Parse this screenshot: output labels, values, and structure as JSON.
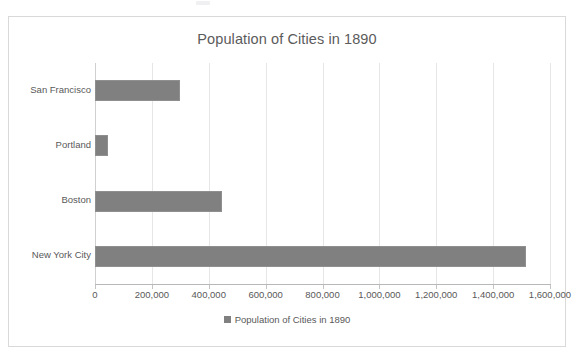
{
  "chart_data": {
    "type": "bar",
    "orientation": "horizontal",
    "title": "Population of Cities in 1890",
    "xlabel": "",
    "ylabel": "",
    "categories": [
      "San Francisco",
      "Portland",
      "Boston",
      "New York City"
    ],
    "values": [
      299000,
      46000,
      448000,
      1515000
    ],
    "series": [
      {
        "name": "Population of Cities in 1890",
        "values": [
          299000,
          46000,
          448000,
          1515000
        ],
        "color": "#808080"
      }
    ],
    "xlim": [
      0,
      1600000
    ],
    "xtick_values": [
      0,
      200000,
      400000,
      600000,
      800000,
      1000000,
      1200000,
      1400000,
      1600000
    ],
    "xtick_labels": [
      "0",
      "200,000",
      "400,000",
      "600,000",
      "800,000",
      "1,000,000",
      "1,200,000",
      "1,400,000",
      "1,600,000"
    ],
    "grid": "vertical",
    "legend": {
      "position": "bottom",
      "entries": [
        {
          "label": "Population of Cities in 1890",
          "color": "#808080",
          "marker": "square"
        }
      ]
    },
    "bar_color": "#808080",
    "title_color": "#5b5b5b",
    "label_color": "#595959",
    "gridline_color": "#e6e6e6",
    "frame_border_color": "#d9d9d9",
    "background_color": "#ffffff"
  }
}
